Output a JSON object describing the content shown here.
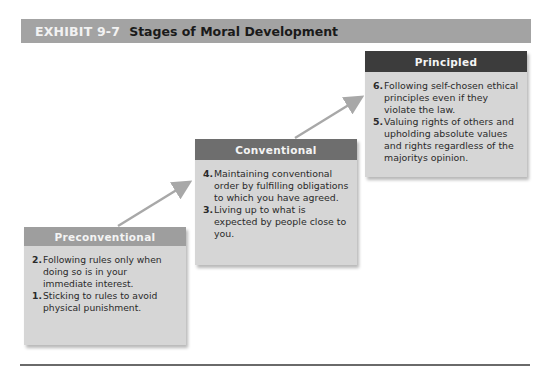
{
  "exhibit": {
    "number": "EXHIBIT 9-7",
    "title": "Stages of Moral Development"
  },
  "stages": [
    {
      "name": "Preconventional",
      "items": [
        {
          "num": "2.",
          "text": "Following rules only when doing so is in your immediate interest."
        },
        {
          "num": "1.",
          "text": "Sticking to rules to avoid physical punishment."
        }
      ]
    },
    {
      "name": "Conventional",
      "items": [
        {
          "num": "4.",
          "text": "Maintaining conventional order by fulfilling obligations to which you have agreed."
        },
        {
          "num": "3.",
          "text": "Living up to what is expected by people close to you."
        }
      ]
    },
    {
      "name": "Principled",
      "items": [
        {
          "num": "6.",
          "text": "Following self-chosen ethical principles even if they violate the law."
        },
        {
          "num": "5.",
          "text": "Valuing rights of others and upholding absolute values and rights regardless of the majoritys opinion."
        }
      ]
    }
  ],
  "colors": {
    "arrow": "#a8a8a8",
    "box_fill": "#d6d6d6",
    "header_pre": "#9e9e9e",
    "header_conv": "#6e6e6e",
    "header_prin": "#3c3c3c"
  }
}
